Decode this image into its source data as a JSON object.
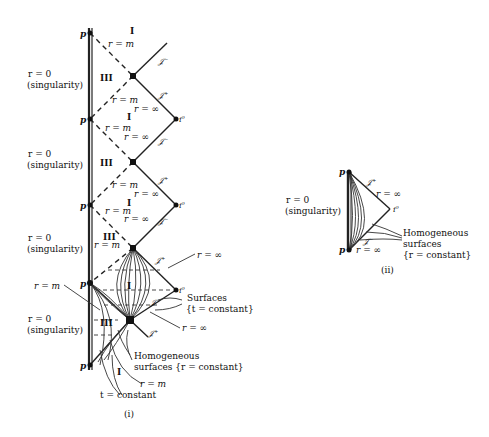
{
  "figure_i": {
    "caption": "(i)",
    "singularity_labels": [
      {
        "line1": "r = 0",
        "line2": "(singularity)"
      },
      {
        "line1": "r = 0",
        "line2": "(singularity)"
      },
      {
        "line1": "r = 0",
        "line2": "(singularity)"
      },
      {
        "line1": "r = 0",
        "line2": "(singularity)"
      }
    ],
    "point_p": "p",
    "point_i0": "i⁰",
    "scri_plus": "𝒥⁺",
    "scri_minus": "𝒥⁻",
    "region_I": "I",
    "region_III": "III",
    "r_m": "r = m",
    "r_inf": "r = ∞",
    "surfaces_t_line1": "Surfaces",
    "surfaces_t_line2": "{t = constant}",
    "homog_line1": "Homogeneous",
    "homog_line2": "surfaces {r = constant}",
    "t_constant": "t = constant"
  },
  "figure_ii": {
    "caption": "(ii)",
    "singularity_line1": "r = 0",
    "singularity_line2": "(singularity)",
    "point_p": "p",
    "point_i0": "i⁰",
    "scri_plus": "𝒥⁺",
    "scri_minus": "𝒥⁻",
    "r_inf_top": "r = ∞",
    "r_inf_bottom": "r = ∞",
    "homog_line1": "Homogeneous",
    "homog_line2": "surfaces",
    "homog_line3": "{r = constant}"
  }
}
